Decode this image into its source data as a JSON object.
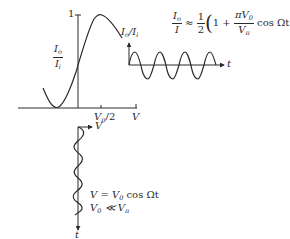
{
  "diagram": {
    "transfer_curve": {
      "y_axis_label": {
        "main": "I",
        "main_sub": "o",
        "den": "I",
        "den_sub": "i"
      },
      "y_tick_label": "1",
      "x_tick_label_main": "V",
      "x_tick_label_sub": "π",
      "x_tick_label_suffix": "/2",
      "x_axis_label": "V"
    },
    "output_signal": {
      "y_axis_label": "I",
      "y_axis_label_sub": "o",
      "y_axis_label_den": "/I",
      "y_axis_label_den_sub": "i",
      "x_axis_label": "t"
    },
    "input_signal": {
      "x_axis_label": "V",
      "time_axis_label": "t"
    },
    "equations": {
      "output_lhs_num": "I",
      "output_lhs_num_sub": "o",
      "output_lhs_den": "I",
      "approx": "≈",
      "half_num": "1",
      "half_den": "2",
      "one_plus": "1 +",
      "pi_v0_num": "πV",
      "pi_v0_num_sub": "0",
      "pi_v0_den": "V",
      "pi_v0_den_sub": "π",
      "cos_term": "cos Ωt",
      "input_line1_prefix": "V = V",
      "input_line1_sub": "0",
      "input_line1_suffix": " cos Ωt",
      "input_line2_prefix": "V",
      "input_line2_sub": "0",
      "input_line2_rel": " ≪ V",
      "input_line2_sub2": "π"
    },
    "colors": {
      "ink": "#2a2a2a",
      "background": "#ffffff"
    }
  }
}
